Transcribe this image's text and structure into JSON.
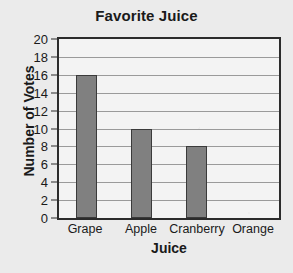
{
  "chart_data": {
    "type": "bar",
    "title": "Favorite Juice",
    "xlabel": "Juice",
    "ylabel": "Number of Votes",
    "categories": [
      "Grape",
      "Apple",
      "Cranberry",
      "Orange"
    ],
    "values": [
      16,
      10,
      8,
      0
    ],
    "ylim": [
      0,
      20
    ],
    "ytick_step": 2,
    "yticks": [
      20,
      18,
      16,
      14,
      12,
      10,
      8,
      6,
      4,
      2,
      0
    ],
    "grid": "horizontal",
    "legend": "none",
    "colors": {
      "bar_fill": "#808080",
      "bar_border": "#3a3a3a",
      "plot_background": "#f3f3f3",
      "page_background": "#ebebeb",
      "axis_line": "#2b2b2b",
      "gridline": "#9a9a9a",
      "text": "#1a1a1a"
    }
  }
}
